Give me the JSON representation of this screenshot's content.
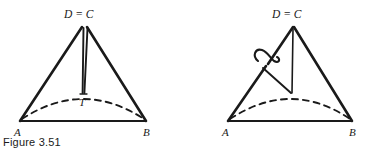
{
  "figure": {
    "caption": "Figure 3.51",
    "colors": {
      "ink": "#1a1a1a",
      "background": "#ffffff"
    },
    "panels": [
      {
        "id": "left-panel",
        "name": "cone-with-axis-to-T",
        "labels": {
          "apex": "D = C",
          "base_left": "A",
          "base_right": "B",
          "interior_point": "T"
        },
        "geometry": {
          "apex": [
            84,
            26
          ],
          "base_left": [
            20,
            121
          ],
          "base_right": [
            146,
            121
          ],
          "interior_point": [
            83,
            93
          ],
          "dashed_arc_kind": "ellipse-back-arc"
        }
      },
      {
        "id": "right-panel",
        "name": "cone-with-twist-loop",
        "labels": {
          "apex": "D = C",
          "base_left": "A",
          "base_right": "B"
        },
        "geometry": {
          "apex": [
            293,
            26
          ],
          "base_left": [
            228,
            121
          ],
          "base_right": [
            352,
            121
          ],
          "interior_point": [
            292,
            93
          ],
          "loop_center": [
            262,
            58
          ],
          "dashed_arc_kind": "ellipse-back-arc",
          "annotation": "loop-twist-mark"
        }
      }
    ]
  }
}
